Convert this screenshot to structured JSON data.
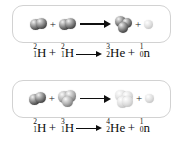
{
  "figure": {
    "background_color": "#ffffff",
    "panel_border_color": "#d2d2d2",
    "arrow_color": "#101010",
    "text_color": "#0d0d0d"
  },
  "reactions": [
    {
      "name": "deuterium-deuterium-fusion",
      "plus_sign": "+",
      "arrow": "arrow-right-icon",
      "reactants": [
        {
          "label": "deuterium",
          "symbol": "H",
          "mass_number": "2",
          "atomic_number": "1",
          "nucleon_count": 2,
          "shade": "dark"
        },
        {
          "label": "deuterium",
          "symbol": "H",
          "mass_number": "2",
          "atomic_number": "1",
          "nucleon_count": 2,
          "shade": "dark"
        }
      ],
      "products": [
        {
          "label": "helium-3",
          "symbol": "He",
          "mass_number": "3",
          "atomic_number": "2",
          "nucleon_count": 3,
          "shade": "dark"
        },
        {
          "label": "neutron",
          "symbol": "n",
          "mass_number": "1",
          "atomic_number": "0",
          "nucleon_count": 1,
          "shade": "light"
        }
      ],
      "equation_text": "2/1 H + 2/1 H ⟶ 3/2 He + 1/0 n"
    },
    {
      "name": "deuterium-tritium-fusion",
      "plus_sign": "+",
      "arrow": "arrow-right-icon",
      "reactants": [
        {
          "label": "deuterium",
          "symbol": "H",
          "mass_number": "2",
          "atomic_number": "1",
          "nucleon_count": 2,
          "shade": "dark"
        },
        {
          "label": "tritium",
          "symbol": "H",
          "mass_number": "3",
          "atomic_number": "1",
          "nucleon_count": 3,
          "shade": "mid"
        }
      ],
      "products": [
        {
          "label": "helium-4",
          "symbol": "He",
          "mass_number": "4",
          "atomic_number": "2",
          "nucleon_count": 4,
          "shade": "light"
        },
        {
          "label": "neutron",
          "symbol": "n",
          "mass_number": "1",
          "atomic_number": "0",
          "nucleon_count": 1,
          "shade": "light"
        }
      ],
      "equation_text": "2/1 H + 3/1 H ⟶ 4/2 He + 1/0 n"
    }
  ]
}
